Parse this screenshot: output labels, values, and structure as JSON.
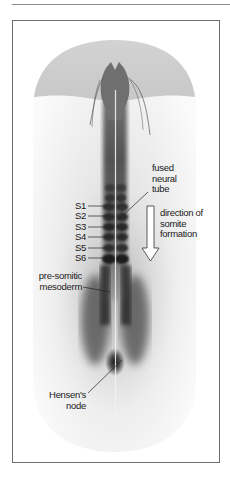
{
  "figure": {
    "type": "embryo diagram",
    "colors": {
      "frame": "#6e6e6e",
      "embryo_body": "#f2f2f2",
      "head_cap": "#cfcfcf",
      "axis_dark": "#2a2a2a",
      "label_text": "#1a1a1a"
    }
  },
  "labels": {
    "fused_neural_tube": [
      "fused",
      "neural",
      "tube"
    ],
    "somites": [
      "S1",
      "S2",
      "S3",
      "S4",
      "S5",
      "S6"
    ],
    "direction": [
      "direction of",
      "somite",
      "formation"
    ],
    "presomitic": [
      "pre-somitic",
      "mesoderm"
    ],
    "hensens": [
      "Hensen's",
      "node"
    ]
  },
  "icons": {
    "direction_arrow": "down-arrow-icon"
  }
}
